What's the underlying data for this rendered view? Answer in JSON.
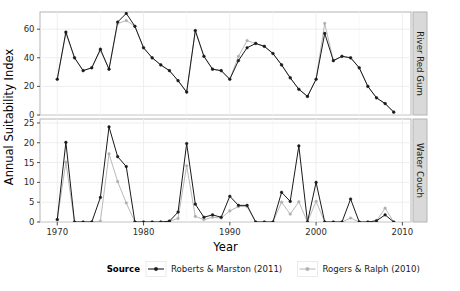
{
  "chart_data": {
    "type": "line",
    "title": "",
    "xlabel": "Year",
    "ylabel": "Annual Suitability Index",
    "grid": true,
    "legend_position": "bottom",
    "legend_title": "Source",
    "facet_direction": "vertical",
    "xlim": [
      1968,
      2011
    ],
    "xticks": [
      1970,
      1980,
      1990,
      2000,
      2010
    ],
    "xtick_labels": [
      "1970",
      "1980",
      "1990",
      "2000",
      "2010"
    ],
    "panels": [
      {
        "label": "River Red Gum",
        "ylim": [
          0,
          72
        ],
        "yticks": [
          0,
          20,
          40,
          60
        ],
        "ytick_labels": [
          "0",
          "20",
          "40",
          "60"
        ],
        "x": [
          1970,
          1971,
          1972,
          1973,
          1974,
          1975,
          1976,
          1977,
          1978,
          1979,
          1980,
          1981,
          1982,
          1983,
          1984,
          1985,
          1986,
          1987,
          1988,
          1989,
          1990,
          1991,
          1992,
          1993,
          1994,
          1995,
          1996,
          1997,
          1998,
          1999,
          2000,
          2001,
          2002,
          2003,
          2004,
          2005,
          2006,
          2007,
          2008,
          2009
        ],
        "series": [
          {
            "name": "Roberts & Marston (2011)",
            "color": "#1a1a1a",
            "values": [
              25,
              58,
              40,
              31,
              33,
              46,
              32,
              65,
              71,
              62,
              47,
              40,
              35,
              31,
              24,
              16,
              59,
              41,
              32,
              31,
              25,
              38,
              47,
              50,
              48,
              43,
              35,
              26,
              18,
              13,
              25,
              57,
              38,
              41,
              40,
              33,
              20,
              12,
              8,
              2
            ]
          },
          {
            "name": "Rogers & Ralph (2010)",
            "color": "#b0b0b0",
            "values": [
              25,
              57,
              40,
              31,
              33,
              45,
              32,
              64,
              66,
              62,
              47,
              40,
              35,
              31,
              24,
              16,
              59,
              41,
              32,
              31,
              25,
              41,
              52,
              50,
              48,
              43,
              35,
              26,
              18,
              13,
              25,
              64,
              38,
              41,
              40,
              33,
              20,
              12,
              8,
              2
            ]
          }
        ]
      },
      {
        "label": "Water Couch",
        "ylim": [
          0,
          26
        ],
        "yticks": [
          0,
          5,
          10,
          15,
          20,
          25
        ],
        "ytick_labels": [
          "0",
          "5",
          "10",
          "15",
          "20",
          "25"
        ],
        "x": [
          1970,
          1971,
          1972,
          1973,
          1974,
          1975,
          1976,
          1977,
          1978,
          1979,
          1980,
          1981,
          1982,
          1983,
          1984,
          1985,
          1986,
          1987,
          1988,
          1989,
          1990,
          1991,
          1992,
          1993,
          1994,
          1995,
          1996,
          1997,
          1998,
          1999,
          2000,
          2001,
          2002,
          2003,
          2004,
          2005,
          2006,
          2007,
          2008,
          2009
        ],
        "series": [
          {
            "name": "Roberts & Marston (2011)",
            "color": "#1a1a1a",
            "values": [
              0.6,
              20.1,
              0,
              0,
              0,
              6.2,
              24,
              16.5,
              14,
              0,
              0,
              0,
              0,
              0.2,
              2.5,
              19.8,
              4.5,
              1.2,
              1.8,
              1.2,
              6.5,
              4.2,
              4.2,
              0,
              0,
              0,
              7.5,
              5.2,
              19.2,
              0,
              10,
              0,
              0,
              0,
              5.8,
              0,
              0,
              0.3,
              1.8,
              0
            ]
          },
          {
            "name": "Rogers & Ralph (2010)",
            "color": "#b0b0b0",
            "values": [
              0.6,
              15.1,
              0,
              0,
              0,
              0.2,
              17.2,
              10.2,
              4.8,
              0,
              0,
              0,
              0,
              0.2,
              0.9,
              14.2,
              1.4,
              0.6,
              1.2,
              1.0,
              2.8,
              3.9,
              3.9,
              0,
              0,
              0,
              5.0,
              2.0,
              5.1,
              0,
              5.2,
              0,
              0,
              0,
              1.0,
              0,
              0,
              0.3,
              3.5,
              0
            ]
          }
        ]
      }
    ],
    "legend_entries": [
      {
        "label": "Roberts & Marston (2011)",
        "color": "#1a1a1a",
        "marker": "filled-circle"
      },
      {
        "label": "Rogers & Ralph (2010)",
        "color": "#b0b0b0",
        "marker": "open-circle"
      }
    ]
  }
}
